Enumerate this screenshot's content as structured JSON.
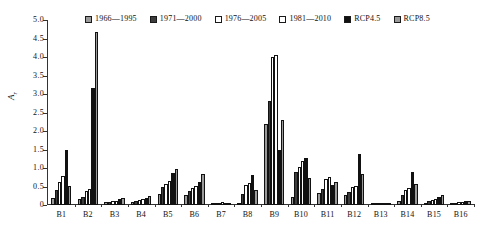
{
  "chart_data": {
    "type": "bar",
    "title": "",
    "xlabel": "",
    "ylabel": "A_r",
    "ylim": [
      0,
      5.0
    ],
    "ytick_labels": [
      "0",
      "0.5",
      "1.0",
      "1.5",
      "2.0",
      "2.5",
      "3.0",
      "3.5",
      "4.0",
      "4.5",
      "5.0"
    ],
    "ytick_values": [
      0,
      0.5,
      1.0,
      1.5,
      2.0,
      2.5,
      3.0,
      3.5,
      4.0,
      4.5,
      5.0
    ],
    "grid": false,
    "legend_position": "top",
    "categories": [
      "B1",
      "B2",
      "B3",
      "B4",
      "B5",
      "B6",
      "B7",
      "B8",
      "B9",
      "B10",
      "B11",
      "B12",
      "B13",
      "B14",
      "B15",
      "B16"
    ],
    "series": [
      {
        "name": "1966—1995",
        "color": "#9a9a9a",
        "values": [
          0.2,
          0.15,
          0.07,
          0.07,
          0.3,
          0.28,
          0.04,
          0.06,
          2.2,
          0.22,
          0.33,
          0.28,
          0.02,
          0.12,
          0.06,
          0.04
        ]
      },
      {
        "name": "1971—2000",
        "color": "#3d3d3d",
        "values": [
          0.4,
          0.22,
          0.09,
          0.1,
          0.5,
          0.38,
          0.05,
          0.3,
          2.8,
          0.9,
          0.42,
          0.36,
          0.03,
          0.26,
          0.1,
          0.06
        ]
      },
      {
        "name": "1976—2005",
        "color": "#ffffff",
        "values": [
          0.62,
          0.38,
          0.11,
          0.14,
          0.58,
          0.46,
          0.06,
          0.55,
          4.0,
          1.02,
          0.7,
          0.48,
          0.05,
          0.4,
          0.14,
          0.08
        ]
      },
      {
        "name": "1981—2010",
        "color": "#ffffff",
        "values": [
          0.78,
          0.44,
          0.12,
          0.16,
          0.66,
          0.52,
          0.07,
          0.6,
          4.05,
          1.2,
          0.75,
          0.52,
          0.06,
          0.46,
          0.16,
          0.09
        ]
      },
      {
        "name": "RCP4.5",
        "color": "#111111",
        "values": [
          1.48,
          3.15,
          0.16,
          0.2,
          0.86,
          0.62,
          0.05,
          0.8,
          1.48,
          1.28,
          0.55,
          1.38,
          0.03,
          0.9,
          0.22,
          0.1
        ]
      },
      {
        "name": "RCP8.5",
        "color": "#9a9a9a",
        "values": [
          0.52,
          4.68,
          0.18,
          0.24,
          0.96,
          0.84,
          0.06,
          0.4,
          2.3,
          0.72,
          0.62,
          0.85,
          0.04,
          0.58,
          0.26,
          0.12
        ]
      }
    ]
  },
  "caption": ""
}
